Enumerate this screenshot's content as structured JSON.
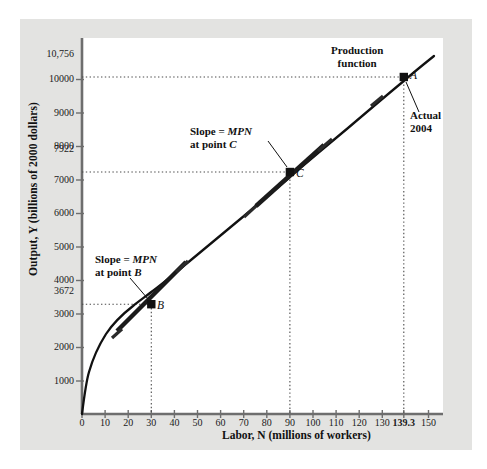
{
  "figure": {
    "background_color": "#e3e3e1",
    "plot_background_color": "#ffffff",
    "curve_color": "#111111",
    "dotted_color": "#555555"
  },
  "axes": {
    "y_axis_title": "Output, Y (billions of 2000 dollars)",
    "x_axis_title": "Labor, N (millions of workers)"
  },
  "annotations": {
    "production_function_line1": "Production",
    "production_function_line2": "function",
    "slope_c_line1_pre": "Slope = ",
    "slope_c_line1_mpn": "MPN",
    "slope_c_line2_pre": "at point ",
    "slope_c_line2_pt": "C",
    "slope_b_line1_pre": "Slope = ",
    "slope_b_line1_mpn": "MPN",
    "slope_b_line2_pre": "at point ",
    "slope_b_line2_pt": "B",
    "actual_line1": "Actual",
    "actual_line2": "2004",
    "point_a_label": "A",
    "point_b_label": "B",
    "point_c_label": "C"
  },
  "chart_data": {
    "type": "line",
    "title": "Production function",
    "xlabel": "Labor, N (millions of workers)",
    "ylabel": "Output, Y (billions of 2000 dollars)",
    "xlim": [
      0,
      157
    ],
    "ylim": [
      0,
      11300
    ],
    "grid": false,
    "legend_position": "none",
    "x_ticks": [
      0,
      10,
      20,
      30,
      40,
      50,
      60,
      70,
      80,
      90,
      100,
      110,
      120,
      130,
      139.3,
      150
    ],
    "x_tick_labels": [
      "0",
      "10",
      "20",
      "30",
      "40",
      "50",
      "60",
      "70",
      "80",
      "90",
      "100",
      "110",
      "120",
      "130",
      "139.3",
      "150"
    ],
    "x_tick_bold": [
      false,
      false,
      false,
      false,
      false,
      false,
      false,
      false,
      false,
      false,
      false,
      false,
      false,
      false,
      true,
      false
    ],
    "y_ticks": [
      1000,
      2000,
      3000,
      3672,
      4000,
      5000,
      6000,
      7000,
      7922,
      8000,
      9000,
      10000,
      10756
    ],
    "y_tick_labels": [
      "1000",
      "2000",
      "3000",
      "3672",
      "4000",
      "5000",
      "6000",
      "7000",
      "7922",
      "8000",
      "9000",
      "10000",
      "10,756"
    ],
    "y_tick_highlight": [
      false,
      false,
      false,
      true,
      false,
      false,
      false,
      false,
      true,
      false,
      false,
      false,
      true
    ],
    "series": [
      {
        "name": "Production function",
        "note": "Y = A*K^0.3*N^0.7 style concave curve through B, C, A",
        "x": [
          0,
          2,
          5,
          10,
          15,
          20,
          25,
          30,
          35,
          40,
          50,
          60,
          70,
          80,
          90,
          100,
          110,
          120,
          130,
          139.3,
          150
        ],
        "y": [
          0,
          620,
          1250,
          1990,
          2530,
          2980,
          3360,
          3672,
          4000,
          4300,
          4880,
          5420,
          5930,
          6420,
          6880,
          7330,
          7770,
          8190,
          8600,
          8960,
          9370
        ]
      }
    ],
    "scaled_series": [
      {
        "name": "Production function (display)",
        "comment": "Actual plotted curve passes (30,3672)=B, (90,7922)=C, (139.3,10756)=A",
        "x": [
          0,
          1,
          2,
          4,
          6,
          9,
          12,
          15,
          20,
          25,
          30,
          40,
          50,
          60,
          70,
          80,
          90,
          100,
          110,
          120,
          130,
          139.3,
          152
        ],
        "y": [
          0,
          430,
          760,
          1230,
          1580,
          1990,
          2330,
          2600,
          2990,
          3350,
          3672,
          4240,
          4760,
          5250,
          5710,
          6150,
          6570,
          6980,
          7370,
          7750,
          8120,
          8440,
          8840
        ]
      }
    ],
    "points": [
      {
        "label": "A",
        "x": 139.3,
        "y": 10756,
        "note": "Actual 2004"
      },
      {
        "label": "B",
        "x": 30,
        "y": 3672,
        "note": "Slope = MPN at point B"
      },
      {
        "label": "C",
        "x": 90,
        "y": 7922,
        "note": "Slope = MPN at point C"
      }
    ],
    "dropline_x_values": [
      30,
      90,
      139.3
    ],
    "dropline_y_values": [
      3672,
      7922,
      10756
    ]
  }
}
